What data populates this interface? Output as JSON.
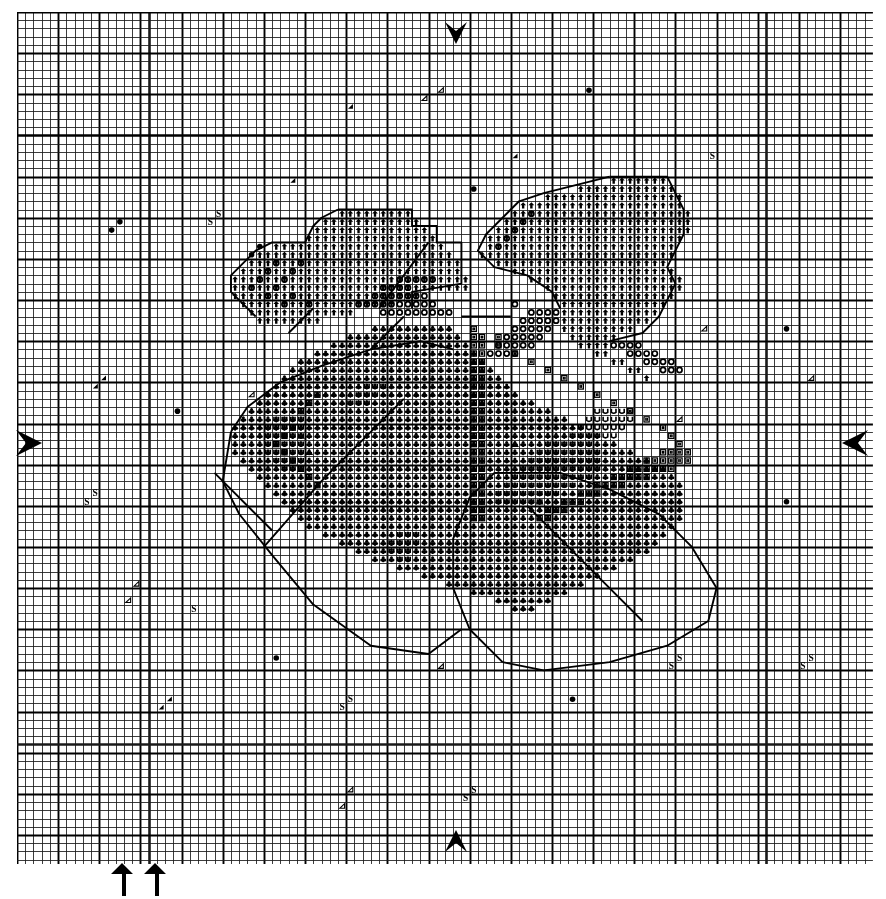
{
  "chart_data": {
    "type": "heatmap",
    "xlabel": "",
    "ylabel": "",
    "grid": true,
    "legend_position": "none",
    "columns": 104,
    "rows": 104,
    "cell_px": 8.23,
    "minor_line_color": "#1a1a1a",
    "major_line_color": "#000000",
    "major_every": 5,
    "extra_bold_rows": [
      15,
      89
    ],
    "extra_bold_cols": [
      16,
      91
    ],
    "background_color": "#ffffff",
    "symbol_legend": [
      {
        "key": "up-arrow",
        "glyph": "↑",
        "name": "up-arrow-stitch",
        "description": "solid up arrow — petal colour 1"
      },
      {
        "key": "circle",
        "glyph": "O",
        "name": "open-circle-stitch",
        "description": "open circle — petal colour 2"
      },
      {
        "key": "club",
        "glyph": "♣",
        "name": "club-stitch",
        "description": "filled club / diamond — leaf colour 1"
      },
      {
        "key": "boxed",
        "glyph": "▣",
        "name": "boxed-square-stitch",
        "description": "square with inner bars — shading colour"
      },
      {
        "key": "u",
        "glyph": "U",
        "name": "u-stitch",
        "description": "letter U — highlight colour"
      },
      {
        "key": "triangle",
        "glyph": "△",
        "name": "open-triangle-stitch",
        "description": "open triangle — accent colour"
      },
      {
        "key": "dot",
        "glyph": "●",
        "name": "filled-dot-stitch",
        "description": "filled dot — background scatter (French knot)"
      },
      {
        "key": "s",
        "glyph": "S",
        "name": "s-letter-stitch",
        "description": "letter S — background scatter"
      },
      {
        "key": "tri-fill",
        "glyph": "◢",
        "name": "filled-corner-triangle",
        "description": "small filled corner triangle — background scatter"
      },
      {
        "key": "tri-open",
        "glyph": "◁",
        "name": "open-left-triangle",
        "description": "small open triangle — background scatter"
      }
    ],
    "edge_markers": [
      {
        "name": "top-centre-marker",
        "glyph": "↓",
        "position": "top",
        "along_px": 441
      },
      {
        "name": "bottom-centre-marker",
        "glyph": "↑",
        "position": "bottom",
        "along_px": 441
      },
      {
        "name": "left-centre-marker",
        "glyph": "▷",
        "position": "left",
        "along_px": 431
      },
      {
        "name": "right-centre-marker",
        "glyph": "◁",
        "position": "right",
        "along_px": 431
      },
      {
        "name": "bottom-outer-arrow-1",
        "glyph": "↑",
        "position": "below-grid",
        "along_px": 105
      },
      {
        "name": "bottom-outer-arrow-2",
        "glyph": "↑",
        "position": "below-grid",
        "along_px": 138
      }
    ],
    "symbol_counts": {
      "up-arrow": 214,
      "circle": 64,
      "club": 430,
      "boxed": 72,
      "u": 66,
      "triangle": 4,
      "dot": 18,
      "s": 13,
      "tri-fill": 7,
      "tri-open": 9
    },
    "cells": [
      {
        "sym": "dot",
        "c": 11,
        "r": 26
      },
      {
        "sym": "dot",
        "c": 12,
        "r": 25
      },
      {
        "sym": "dot",
        "c": 28,
        "r": 29
      },
      {
        "sym": "dot",
        "c": 29,
        "r": 28
      },
      {
        "sym": "s",
        "c": 23,
        "r": 25
      },
      {
        "sym": "s",
        "c": 24,
        "r": 24
      },
      {
        "sym": "s",
        "c": 8,
        "r": 59
      },
      {
        "sym": "s",
        "c": 9,
        "r": 58
      },
      {
        "sym": "s",
        "c": 21,
        "r": 72
      },
      {
        "sym": "s",
        "c": 84,
        "r": 17
      },
      {
        "sym": "s",
        "c": 79,
        "r": 79
      },
      {
        "sym": "s",
        "c": 80,
        "r": 78
      },
      {
        "sym": "s",
        "c": 95,
        "r": 79
      },
      {
        "sym": "s",
        "c": 96,
        "r": 78
      },
      {
        "sym": "s",
        "c": 39,
        "r": 84
      },
      {
        "sym": "s",
        "c": 40,
        "r": 83
      },
      {
        "sym": "s",
        "c": 54,
        "r": 95
      },
      {
        "sym": "s",
        "c": 55,
        "r": 94
      },
      {
        "sym": "dot",
        "c": 55,
        "r": 21
      },
      {
        "sym": "dot",
        "c": 69,
        "r": 9
      },
      {
        "sym": "dot",
        "c": 93,
        "r": 38
      },
      {
        "sym": "dot",
        "c": 19,
        "r": 48
      },
      {
        "sym": "dot",
        "c": 93,
        "r": 59
      },
      {
        "sym": "dot",
        "c": 31,
        "r": 78
      },
      {
        "sym": "dot",
        "c": 67,
        "r": 83
      },
      {
        "sym": "tri-open",
        "c": 51,
        "r": 9
      },
      {
        "sym": "tri-open",
        "c": 49,
        "r": 10
      },
      {
        "sym": "tri-fill",
        "c": 40,
        "r": 11
      },
      {
        "sym": "tri-fill",
        "c": 60,
        "r": 17
      },
      {
        "sym": "tri-fill",
        "c": 33,
        "r": 20
      },
      {
        "sym": "tri-fill",
        "c": 9,
        "r": 45
      },
      {
        "sym": "tri-fill",
        "c": 10,
        "r": 44
      },
      {
        "sym": "tri-open",
        "c": 28,
        "r": 46
      },
      {
        "sym": "tri-open",
        "c": 83,
        "r": 38
      },
      {
        "sym": "tri-open",
        "c": 96,
        "r": 44
      },
      {
        "sym": "tri-open",
        "c": 80,
        "r": 49
      },
      {
        "sym": "tri-open",
        "c": 14,
        "r": 69
      },
      {
        "sym": "tri-open",
        "c": 13,
        "r": 71
      },
      {
        "sym": "tri-open",
        "c": 51,
        "r": 79
      },
      {
        "sym": "tri-fill",
        "c": 17,
        "r": 84
      },
      {
        "sym": "tri-fill",
        "c": 18,
        "r": 83
      },
      {
        "sym": "tri-open",
        "c": 40,
        "r": 94
      },
      {
        "sym": "tri-open",
        "c": 39,
        "r": 96
      }
    ]
  },
  "page": {
    "width": 886,
    "height": 899
  }
}
